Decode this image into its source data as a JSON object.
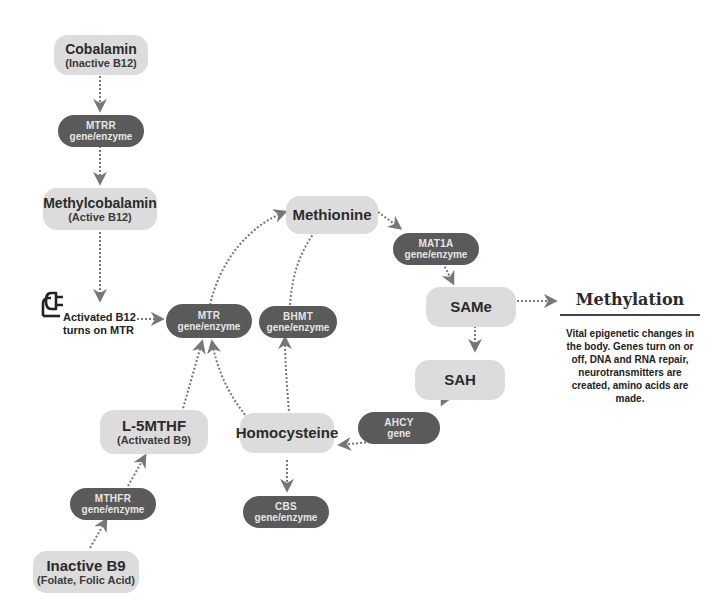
{
  "diagram": {
    "nodes": {
      "cobalamin": {
        "line1": "Cobalamin",
        "line2": "(Inactive B12)"
      },
      "mtrr": {
        "line1": "MTRR",
        "line2": "gene/enzyme"
      },
      "methylcobalamin": {
        "line1": "Methylcobalamin",
        "line2": "(Active B12)"
      },
      "mtr": {
        "line1": "MTR",
        "line2": "gene/enzyme"
      },
      "methionine": {
        "line1": "Methionine"
      },
      "mat1a": {
        "line1": "MAT1A",
        "line2": "gene/enzyme"
      },
      "bhmt": {
        "line1": "BHMT",
        "line2": "gene/enzyme"
      },
      "same": {
        "line1": "SAMe"
      },
      "sah": {
        "line1": "SAH"
      },
      "ahcy": {
        "line1": "AHCY",
        "line2": "gene"
      },
      "homocysteine": {
        "line1": "Homocysteine"
      },
      "cbs": {
        "line1": "CBS",
        "line2": "gene/enzyme"
      },
      "l5mthf": {
        "line1": "L-5MTHF",
        "line2": "(Activated B9)"
      },
      "mthfr": {
        "line1": "MTHFR",
        "line2": "gene/enzyme"
      },
      "inactive_b9": {
        "line1": "Inactive B9",
        "line2": "(Folate, Folic Acid)"
      }
    },
    "b12_label": {
      "line1": "Activated B12",
      "line2": "turns on MTR",
      "icon": "plug-icon"
    },
    "methylation": {
      "title": "Methylation",
      "description": "Vital epigenetic changes in the body. Genes turn on or off, DNA and RNA repair, neurotransmitters are created, amino acids are made."
    },
    "colors": {
      "substrate": "#dcdcdc",
      "enzyme": "#5a5a5a",
      "arrow": "#777777"
    }
  }
}
